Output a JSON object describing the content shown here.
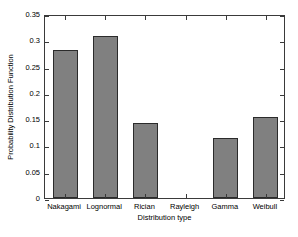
{
  "chart_data": {
    "type": "bar",
    "title": "",
    "subtitle": "",
    "xlabel": "Distribution type",
    "ylabel": "Probability Distribution Function",
    "categories": [
      "Nakagami",
      "Lognormal",
      "Rician",
      "Rayleigh",
      "Gamma",
      "Weibull"
    ],
    "values": [
      0.282,
      0.308,
      0.142,
      0,
      0.115,
      0.154
    ],
    "series": [
      {
        "name": "Probability Distribution Function",
        "values": [
          0.282,
          0.308,
          0.142,
          0,
          0.115,
          0.154
        ]
      }
    ],
    "ylim": [
      0,
      0.35
    ],
    "yticks": [
      0,
      0.05,
      0.1,
      0.15,
      0.2,
      0.25,
      0.3,
      0.35
    ],
    "ytick_labels": [
      "0",
      "0.05",
      "0.1",
      "0.15",
      "0.2",
      "0.25",
      "0.3",
      "0.35"
    ],
    "grid": false,
    "legend": null,
    "legend_position": "none",
    "bar_color": "#808080",
    "bar_edge_color": "#2b2b2b",
    "axis_color": "#3a3a3a",
    "background_color": "#ffffff",
    "annotations": []
  }
}
